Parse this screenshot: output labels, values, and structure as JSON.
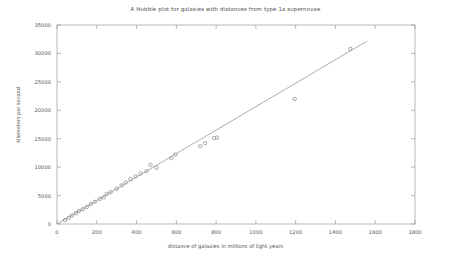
{
  "chart_data": {
    "type": "scatter",
    "title": "A Hubble plot for galaxies with distances from type 1a supernovae",
    "xlabel": "distance of galaxies in millions of light years",
    "ylabel": "kilometers per second",
    "xlim": [
      0,
      1800
    ],
    "ylim": [
      0,
      35000
    ],
    "xticks": [
      0,
      200,
      400,
      600,
      800,
      1000,
      1200,
      1400,
      1600,
      1800
    ],
    "yticks": [
      0,
      5000,
      10000,
      15000,
      20000,
      25000,
      30000,
      35000
    ],
    "grid": false,
    "legend": null,
    "marker": "open-circle",
    "marker_color": "#8a8a8a",
    "line_color": "#8a8a8a",
    "series": [
      {
        "name": "galaxies",
        "type": "scatter",
        "points": [
          {
            "x": 40,
            "y": 700
          },
          {
            "x": 60,
            "y": 1100
          },
          {
            "x": 75,
            "y": 1500
          },
          {
            "x": 95,
            "y": 1900
          },
          {
            "x": 110,
            "y": 2300
          },
          {
            "x": 130,
            "y": 2600
          },
          {
            "x": 150,
            "y": 3000
          },
          {
            "x": 170,
            "y": 3500
          },
          {
            "x": 190,
            "y": 3900
          },
          {
            "x": 215,
            "y": 4400
          },
          {
            "x": 235,
            "y": 4700
          },
          {
            "x": 250,
            "y": 5300
          },
          {
            "x": 270,
            "y": 5600
          },
          {
            "x": 300,
            "y": 6200
          },
          {
            "x": 325,
            "y": 6800
          },
          {
            "x": 345,
            "y": 7300
          },
          {
            "x": 370,
            "y": 7900
          },
          {
            "x": 395,
            "y": 8400
          },
          {
            "x": 420,
            "y": 8900
          },
          {
            "x": 450,
            "y": 9300
          },
          {
            "x": 470,
            "y": 10400
          },
          {
            "x": 500,
            "y": 9900
          },
          {
            "x": 575,
            "y": 11600
          },
          {
            "x": 595,
            "y": 12200
          },
          {
            "x": 720,
            "y": 13700
          },
          {
            "x": 745,
            "y": 14200
          },
          {
            "x": 790,
            "y": 15100
          },
          {
            "x": 805,
            "y": 15200
          },
          {
            "x": 1195,
            "y": 22000
          },
          {
            "x": 1475,
            "y": 30800
          }
        ]
      },
      {
        "name": "fit-line",
        "type": "line",
        "points": [
          {
            "x": 0,
            "y": 0
          },
          {
            "x": 1560,
            "y": 32200
          }
        ]
      }
    ]
  }
}
